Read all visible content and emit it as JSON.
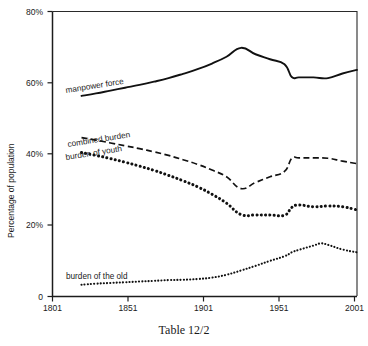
{
  "chart_data": {
    "type": "line",
    "title": "",
    "caption": "Table 12/2",
    "xlabel": "",
    "ylabel": "Percentage of population",
    "xlim": [
      1801,
      2011
    ],
    "ylim": [
      0,
      80
    ],
    "grid": false,
    "legend_position": "inline-labels",
    "xticks": [
      1801,
      1851,
      1901,
      1951,
      2001
    ],
    "xtick_labels": [
      "1801",
      "1851",
      "1901",
      "1951",
      "2001"
    ],
    "yticks": [
      0,
      20,
      40,
      60,
      80
    ],
    "ytick_labels": [
      "0",
      "20%",
      "40%",
      "60%",
      "80%"
    ],
    "series": [
      {
        "name": "manpower force",
        "style": "solid",
        "label": "manpower force",
        "x": [
          1821,
          1831,
          1841,
          1851,
          1861,
          1871,
          1881,
          1891,
          1901,
          1911,
          1921,
          1931,
          1941,
          1951,
          1961,
          1966,
          1971,
          1981,
          1991,
          2001,
          2011
        ],
        "values": [
          56.3,
          57.0,
          57.8,
          58.6,
          59.4,
          60.3,
          61.3,
          62.5,
          63.8,
          65.4,
          67.3,
          69.8,
          68.0,
          66.6,
          65.2,
          61.6,
          61.5,
          61.5,
          61.3,
          62.6,
          63.6
        ]
      },
      {
        "name": "combined burden",
        "style": "dashed",
        "label": "combined burden",
        "x": [
          1821,
          1831,
          1841,
          1851,
          1861,
          1871,
          1881,
          1891,
          1901,
          1911,
          1921,
          1931,
          1941,
          1951,
          1961,
          1966,
          1971,
          1981,
          1991,
          2001,
          2011
        ],
        "values": [
          44.6,
          43.9,
          43.1,
          42.3,
          41.5,
          40.6,
          39.6,
          38.4,
          37.1,
          35.5,
          33.6,
          30.3,
          32.0,
          33.6,
          35.1,
          38.8,
          38.9,
          38.9,
          38.8,
          38.0,
          37.3
        ]
      },
      {
        "name": "burden of youth",
        "style": "dotted-thick",
        "label": "burden of youth",
        "x": [
          1821,
          1831,
          1841,
          1851,
          1861,
          1871,
          1881,
          1891,
          1901,
          1911,
          1921,
          1931,
          1941,
          1951,
          1961,
          1966,
          1971,
          1981,
          1991,
          2001,
          2011
        ],
        "values": [
          40.4,
          39.6,
          38.7,
          37.7,
          36.6,
          35.4,
          34.0,
          32.5,
          30.8,
          28.7,
          26.2,
          23.0,
          22.9,
          22.9,
          22.8,
          25.0,
          25.7,
          25.2,
          25.4,
          25.2,
          24.3
        ]
      },
      {
        "name": "burden of the old",
        "style": "dotted-thin",
        "label": "burden of the old",
        "x": [
          1821,
          1831,
          1841,
          1851,
          1861,
          1871,
          1881,
          1891,
          1901,
          1911,
          1921,
          1931,
          1941,
          1951,
          1961,
          1966,
          1971,
          1981,
          1986,
          1991,
          2001,
          2011
        ],
        "values": [
          3.3,
          3.6,
          3.8,
          4.0,
          4.2,
          4.4,
          4.6,
          4.7,
          4.9,
          5.3,
          6.1,
          7.3,
          8.6,
          10.0,
          11.3,
          12.4,
          13.1,
          14.3,
          14.9,
          14.5,
          13.2,
          12.4
        ]
      }
    ]
  },
  "axes": {
    "y_axis_title": "Percentage of population",
    "y_ticks": [
      {
        "label": "80%",
        "value": 80
      },
      {
        "label": "60%",
        "value": 60
      },
      {
        "label": "40%",
        "value": 40
      },
      {
        "label": "20%",
        "value": 20
      },
      {
        "label": "0",
        "value": 0
      }
    ],
    "x_ticks": [
      {
        "label": "1801",
        "value": 1801
      },
      {
        "label": "1851",
        "value": 1851
      },
      {
        "label": "1901",
        "value": 1901
      },
      {
        "label": "1951",
        "value": 1951
      },
      {
        "label": "2001",
        "value": 2001
      }
    ]
  },
  "annotations": {
    "manpower_force": "manpower force",
    "combined_burden": "combined burden",
    "burden_of_youth": "burden of youth",
    "burden_of_the_old": "burden of the old"
  },
  "caption": {
    "text": "Table 12/2"
  }
}
